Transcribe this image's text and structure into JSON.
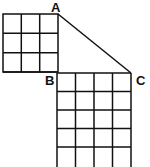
{
  "figure": {
    "labels": {
      "A": "A",
      "B": "B",
      "C": "C"
    },
    "top_square": {
      "rows": 3,
      "cols": 3
    },
    "bottom_grid": {
      "cols": 4,
      "rows_visible": 5
    },
    "line_color": "#111111",
    "segment": "AC"
  }
}
